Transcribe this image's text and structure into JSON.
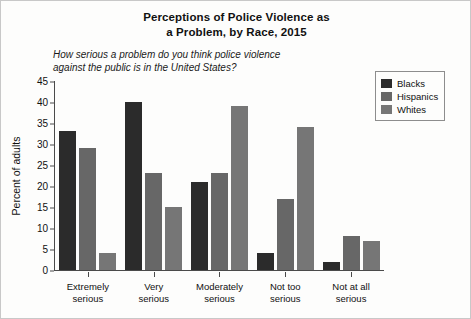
{
  "chart_data": {
    "type": "bar",
    "title": "Perceptions of Police Violence as a Problem, by Race, 2015",
    "title_line1": "Perceptions of Police Violence as",
    "title_line2": "a Problem, by Race, 2015",
    "subtitle": "How serious a problem do you think police violence against the public is in the United States?",
    "subtitle_line1": "How serious a problem do you think police violence",
    "subtitle_line2": "against the public is in the United States?",
    "xlabel": "",
    "ylabel": "Percent of adults",
    "ylim": [
      0,
      45
    ],
    "ytick_step": 5,
    "yticks": [
      45,
      40,
      35,
      30,
      25,
      20,
      15,
      10,
      5,
      0
    ],
    "grid": false,
    "legend_position": "top-right",
    "categories": [
      "Extremely serious",
      "Very serious",
      "Moderately serious",
      "Not too serious",
      "Not at all serious"
    ],
    "categories_wrapped": [
      [
        "Extremely",
        "serious"
      ],
      [
        "Very",
        "serious"
      ],
      [
        "Moderately",
        "serious"
      ],
      [
        "Not too",
        "serious"
      ],
      [
        "Not at all",
        "serious"
      ]
    ],
    "series": [
      {
        "name": "Blacks",
        "color": "#2b2b2b",
        "values": [
          33,
          40,
          21,
          4,
          2
        ]
      },
      {
        "name": "Hispanics",
        "color": "#676767",
        "values": [
          29,
          23,
          23,
          17,
          8
        ]
      },
      {
        "name": "Whites",
        "color": "#767676",
        "values": [
          4,
          15,
          39,
          34,
          7
        ]
      }
    ]
  }
}
